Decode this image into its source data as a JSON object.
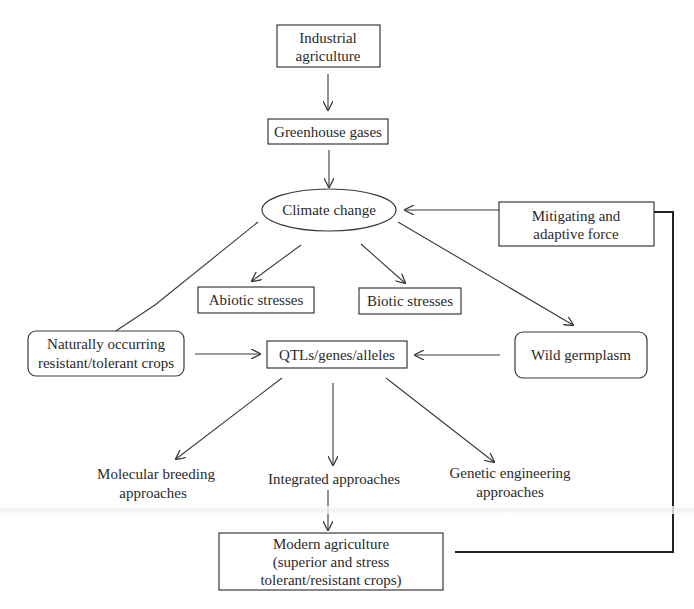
{
  "diagram": {
    "nodes": {
      "industrial_agriculture": {
        "line1": "Industrial",
        "line2": "agriculture"
      },
      "greenhouse_gases": {
        "label": "Greenhouse gases"
      },
      "climate_change": {
        "label": "Climate change"
      },
      "mitigating_force": {
        "line1": "Mitigating and",
        "line2": "adaptive force"
      },
      "abiotic_stresses": {
        "label": "Abiotic stresses"
      },
      "biotic_stresses": {
        "label": "Biotic stresses"
      },
      "naturally_occurring": {
        "line1": "Naturally occurring",
        "line2": "resistant/tolerant crops"
      },
      "qtls": {
        "label": "QTLs/genes/alleles"
      },
      "wild_germplasm": {
        "label": "Wild germplasm"
      },
      "molecular_breeding": {
        "line1": "Molecular breeding",
        "line2": "approaches"
      },
      "integrated": {
        "label": "Integrated approaches"
      },
      "genetic_engineering": {
        "line1": "Genetic engineering",
        "line2": "approaches"
      },
      "modern_agriculture": {
        "line1": "Modern agriculture",
        "line2": "(superior and stress",
        "line3": "tolerant/resistant crops)"
      }
    },
    "edges": [
      {
        "from": "Industrial agriculture",
        "to": "Greenhouse gases"
      },
      {
        "from": "Greenhouse gases",
        "to": "Climate change"
      },
      {
        "from": "Mitigating and adaptive force",
        "to": "Climate change"
      },
      {
        "from": "Climate change",
        "to": "Abiotic stresses"
      },
      {
        "from": "Climate change",
        "to": "Biotic stresses"
      },
      {
        "from": "Climate change",
        "to": "Naturally occurring resistant/tolerant crops"
      },
      {
        "from": "Climate change",
        "to": "Wild germplasm"
      },
      {
        "from": "Naturally occurring resistant/tolerant crops",
        "to": "QTLs/genes/alleles"
      },
      {
        "from": "Wild germplasm",
        "to": "QTLs/genes/alleles"
      },
      {
        "from": "QTLs/genes/alleles",
        "to": "Molecular breeding approaches"
      },
      {
        "from": "QTLs/genes/alleles",
        "to": "Integrated approaches"
      },
      {
        "from": "QTLs/genes/alleles",
        "to": "Genetic engineering approaches"
      },
      {
        "from": "Integrated approaches",
        "to": "Modern agriculture"
      },
      {
        "from": "Modern agriculture",
        "to": "Mitigating and adaptive force"
      }
    ]
  }
}
